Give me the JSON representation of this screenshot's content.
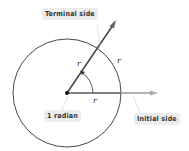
{
  "diagram": {
    "labels": {
      "terminal_side": "Terminal side",
      "initial_side": "Initial side",
      "angle": "1 radian",
      "radius_on_terminal": "r",
      "arc_length": "r",
      "radius_on_initial": "r"
    },
    "colors": {
      "terminal_ray": "#444444",
      "initial_ray": "#999999",
      "circle": "#333333",
      "label_bg": "#ececec"
    },
    "geometry": {
      "center": [
        67,
        93
      ],
      "radius": 54,
      "angle_radians": 1
    }
  }
}
